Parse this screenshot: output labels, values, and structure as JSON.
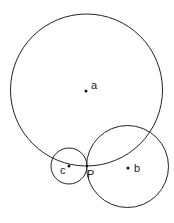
{
  "diagram": {
    "stroke_color": "#222222",
    "circles": [
      {
        "label": "a",
        "cx": 86.5,
        "cy": 90,
        "r": 76,
        "dot": [
          86,
          91
        ],
        "label_pos": [
          91,
          89
        ]
      },
      {
        "label": "b",
        "cx": 127.5,
        "cy": 166.5,
        "r": 41,
        "dot": [
          128,
          168
        ],
        "label_pos": [
          134,
          172
        ]
      },
      {
        "label": "c",
        "cx": 69,
        "cy": 166,
        "r": 18,
        "dot": [
          69,
          166
        ],
        "label_pos": [
          60,
          174
        ]
      }
    ],
    "point": {
      "label": "P",
      "x": 87,
      "y": 166,
      "label_pos": [
        87,
        178
      ]
    }
  }
}
